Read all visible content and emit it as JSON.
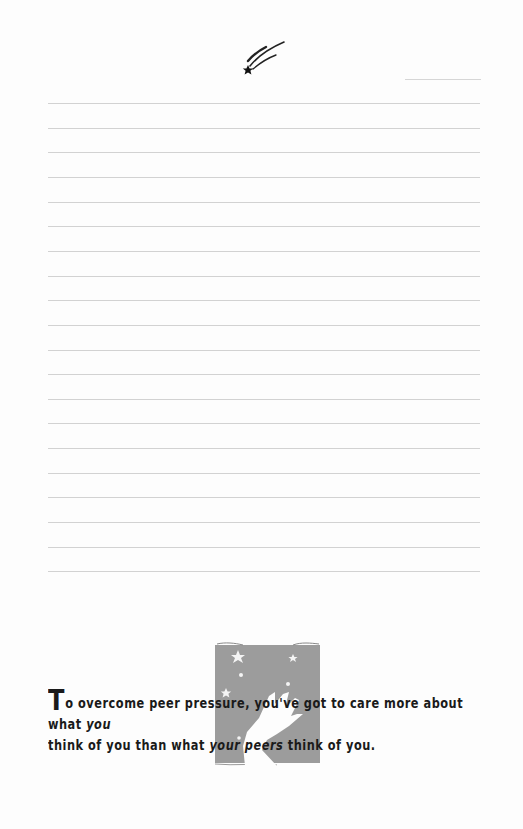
{
  "decoration": {
    "top_icon": "shooting-star-icon",
    "illustration": "night-sky-hand-illustration",
    "colors": {
      "paper": "#fdfdfd",
      "rule": "#d2d2d2",
      "illustration_fill": "#9a9a9a",
      "text": "#1a1a1a"
    }
  },
  "ruled_lines": {
    "count": 20,
    "first_y": 103,
    "spacing": 24.65
  },
  "quote": {
    "dropcap": "T",
    "part1": "o overcome peer pressure, you've got to care more about what ",
    "emph1": "you",
    "part2": " think of you than what ",
    "emph2": "your peers",
    "part3": " think of you."
  }
}
